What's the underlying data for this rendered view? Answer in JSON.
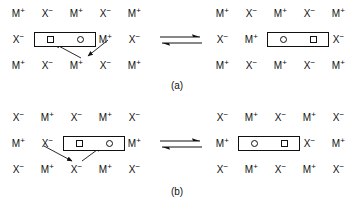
{
  "figure": {
    "type": "ionic-lattice-defect-diagram",
    "ion_cation": "M",
    "ion_anion": "X",
    "cation_charge": "+",
    "anion_charge": "−",
    "equilibrium_symbol": "reversible-double-harpoon"
  },
  "panels": [
    {
      "id": "a",
      "caption": "(a)",
      "left": {
        "rows": [
          [
            "M+",
            "X-",
            "M+",
            "X-",
            "M+"
          ],
          [
            "X-",
            "BOX",
            "BOX",
            "M+",
            "X-"
          ],
          [
            "M+",
            "X-",
            "M+",
            "X-",
            "M+"
          ]
        ],
        "box": {
          "left_symbol": "square",
          "right_symbol": "circle",
          "col_start": 1,
          "row": 1
        },
        "arrows": [
          {
            "from": "row3-col2",
            "to": "box-left",
            "head": "up-left"
          },
          {
            "from": "row2-col3",
            "to": "row3-col2",
            "head": "down-left"
          }
        ]
      },
      "right": {
        "rows": [
          [
            "M+",
            "X-",
            "M+",
            "X-",
            "M+"
          ],
          [
            "X-",
            "M+",
            "BOX",
            "BOX",
            "X-"
          ],
          [
            "M+",
            "X-",
            "M+",
            "X-",
            "M+"
          ]
        ],
        "box": {
          "left_symbol": "circle",
          "right_symbol": "square",
          "col_start": 2,
          "row": 1
        },
        "arrows": []
      }
    },
    {
      "id": "b",
      "caption": "(b)",
      "left": {
        "rows": [
          [
            "X-",
            "M+",
            "X-",
            "M+",
            "X-"
          ],
          [
            "M+",
            "X-",
            "BOX",
            "BOX",
            "M+"
          ],
          [
            "X-",
            "M+",
            "X-",
            "M+",
            "X-"
          ]
        ],
        "box": {
          "left_symbol": "square",
          "right_symbol": "circle",
          "col_start": 2,
          "row": 1
        },
        "arrows": [
          {
            "from": "row2-col2",
            "to": "row3-col3",
            "head": "down-right"
          },
          {
            "from": "row3-col3",
            "to": "box-right",
            "head": "up-right"
          }
        ]
      },
      "right": {
        "rows": [
          [
            "X-",
            "M+",
            "X-",
            "M+",
            "X-"
          ],
          [
            "M+",
            "BOX",
            "BOX",
            "X-",
            "M+"
          ],
          [
            "X-",
            "M+",
            "X-",
            "M+",
            "X-"
          ]
        ],
        "box": {
          "left_symbol": "circle",
          "right_symbol": "square",
          "col_start": 1,
          "row": 1
        },
        "arrows": []
      }
    }
  ],
  "labels": {
    "cation": "M",
    "anion": "X",
    "sup_plus": "+",
    "sup_minus": "−"
  }
}
